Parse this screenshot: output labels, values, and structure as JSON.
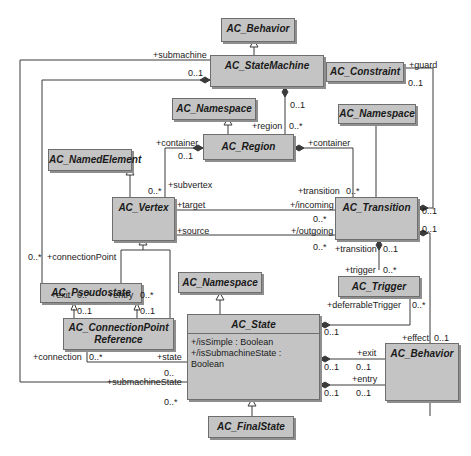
{
  "diagram": {
    "type": "UML class diagram",
    "classes": {
      "behavior_top": "AC_Behavior",
      "state_machine": "AC_StateMachine",
      "constraint": "AC_Constraint",
      "namespace_region": "AC_Namespace",
      "namespace_transition": "AC_Namespace",
      "region": "AC_Region",
      "named_element": "AC_NamedElement",
      "vertex": "AC_Vertex",
      "transition": "AC_Transition",
      "pseudostate": "AC_Pseudostate",
      "namespace_state": "AC_Namespace",
      "trigger": "AC_Trigger",
      "connection_point_reference_line1": "AC_ConnectionPoint",
      "connection_point_reference_line2": "Reference",
      "state": "AC_State",
      "behavior_bottom": "AC_Behavior",
      "final_state": "AC_FinalState"
    },
    "state_attributes": [
      "+/isSimple : Boolean",
      "+/isSubmachineState : Boolean"
    ],
    "labels": {
      "submachine": "+submachine",
      "submachine_mult": "0..1",
      "guard": "+guard",
      "guard_mult": "0..1",
      "sm_region_mult": "0..1",
      "region_role": "+region",
      "region_mult": "0..*",
      "region_container": "+container",
      "region_container_mult": "0..1",
      "transition_container": "+container",
      "subvertex": "+subvertex",
      "subvertex_mult": "0..*",
      "target": "+target",
      "source": "+source",
      "transition_role": "+transition",
      "transition_mult": "0..*",
      "incoming": "+/incoming",
      "incoming_mult": "0..*",
      "outgoing": "+/outgoing",
      "outgoing_mult": "0..*",
      "guard_transition_mult": "0..1",
      "effect_transition_mult": "0..1",
      "trigger_transition": "+transition",
      "trigger_transition_mult": "0..1",
      "trigger_role": "+trigger",
      "trigger_mult": "0..*",
      "connection_point": "+connectionPoint",
      "connection_point_mult": "0..*",
      "exit_ps": "+exit",
      "exit_ps_mult": "0..*",
      "entry_ps": "+entry",
      "entry_ps_mult": "0..*",
      "cpr_exit_mult": "0..1",
      "cpr_entry_mult": "0..1",
      "deferrable_trigger": "+deferrableTrigger",
      "deferrable_trigger_mult": "0..*",
      "deferrable_state_mult": "0..1",
      "effect": "+effect",
      "effect_mult": "0..1",
      "connection": "+connection",
      "connection_mult": "0..*",
      "state_role": "+state",
      "state_mult": "0..",
      "submachine_state": "+submachineState",
      "submachine_state_mult": "0..*",
      "exit_behavior": "+exit",
      "exit_state_mult": "0..1",
      "exit_behavior_mult": "0..1",
      "entry_behavior": "+entry",
      "entry_state_mult": "0..1",
      "entry_behavior_mult": "0..1"
    }
  }
}
